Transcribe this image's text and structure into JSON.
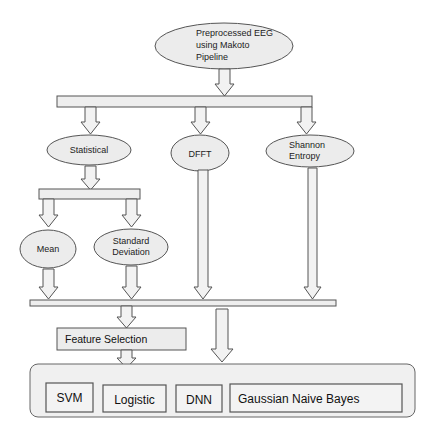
{
  "diagram": {
    "source": {
      "lines": [
        "Preprocessed EEG",
        "using Makoto",
        "Pipeline"
      ]
    },
    "features": {
      "statistical": "Statistical",
      "dfft": "DFFT",
      "shannon": {
        "lines": [
          "Shannon",
          "Entropy"
        ]
      },
      "mean": "Mean",
      "std": {
        "lines": [
          "Standard",
          "Deviation"
        ]
      }
    },
    "feature_selection": "Feature Selection",
    "classifiers": [
      "SVM",
      "Logistic",
      "DNN",
      "Gaussian Naive Bayes"
    ]
  },
  "colors": {
    "fill": "#ececec",
    "stroke": "#555555",
    "background": "#ffffff"
  }
}
